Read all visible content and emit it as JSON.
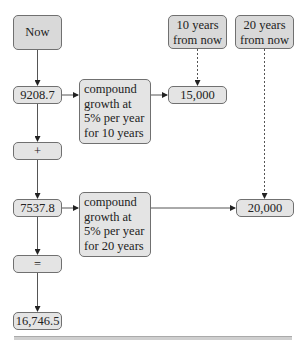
{
  "diagram": {
    "now": "Now",
    "future_10": [
      "10 years",
      "from now"
    ],
    "future_20": [
      "20 years",
      "from now"
    ],
    "present_value_1": "9208.7",
    "present_value_2": "7537.8",
    "plus": "+",
    "equals": "=",
    "total": "16,746.5",
    "growth_10": [
      "compound",
      "growth at",
      "5% per year",
      "for 10 years"
    ],
    "growth_20": [
      "compound",
      "growth at",
      "5% per year",
      "for 20 years"
    ],
    "future_value_1": "15,000",
    "future_value_2": "20,000"
  },
  "colors": {
    "box_fill": "#e4e4e4",
    "border": "#707070",
    "line": "#444444"
  }
}
